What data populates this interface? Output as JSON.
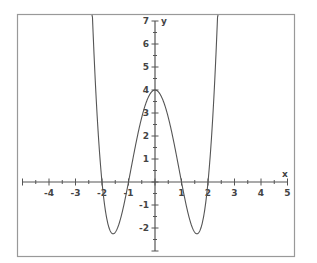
{
  "chart_data": {
    "type": "line",
    "title": "",
    "function": "y = (x^2 - 1)(x^2 - 4)",
    "xlabel": "x",
    "ylabel": "y",
    "xlim": [
      -5.2,
      5
    ],
    "ylim": [
      -3,
      7.3
    ],
    "x_ticks": [
      -4,
      -3,
      -2,
      -1,
      1,
      2,
      3,
      4,
      5
    ],
    "y_ticks": [
      -2,
      -1,
      1,
      2,
      3,
      4,
      5,
      6,
      7
    ],
    "minor_tick_step": 0.5,
    "grid": false,
    "series": [
      {
        "name": "f(x)",
        "key_points": [
          {
            "x": -2.36,
            "y": 7
          },
          {
            "x": -2,
            "y": 0
          },
          {
            "x": -1.58,
            "y": -2.25
          },
          {
            "x": -1,
            "y": 0
          },
          {
            "x": 0,
            "y": 4
          },
          {
            "x": 1,
            "y": 0
          },
          {
            "x": 1.58,
            "y": -2.25
          },
          {
            "x": 2,
            "y": 0
          },
          {
            "x": 2.36,
            "y": 7
          }
        ]
      }
    ],
    "colors": {
      "curve": "#555555",
      "axis": "#555555",
      "frame": "#888888",
      "labels": "#444444"
    }
  }
}
